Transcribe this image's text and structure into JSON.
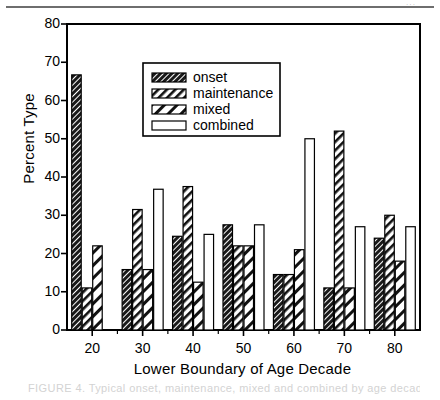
{
  "figure": {
    "top_rule": true,
    "top_corner_mark": "···",
    "caption": "FIGURE 4. Typical onset, maintenance, mixed and combined by age decade"
  },
  "chart_data": {
    "type": "bar",
    "title": "",
    "xlabel": "Lower Boundary of Age Decade",
    "ylabel": "Percent Type",
    "categories": [
      "20",
      "30",
      "40",
      "50",
      "60",
      "70",
      "80"
    ],
    "ylim": [
      0,
      80
    ],
    "yticks": [
      0,
      10,
      20,
      30,
      40,
      50,
      60,
      70,
      80
    ],
    "ytick_labels": [
      "0",
      "10",
      "20",
      "30",
      "40",
      "50",
      "60",
      "70",
      "80"
    ],
    "grid": false,
    "legend_position": "upper center",
    "series": [
      {
        "name": "onset",
        "pattern": "dense-hatch",
        "values": [
          66.7,
          15.8,
          24.5,
          27.5,
          14.5,
          11.0,
          24.0
        ]
      },
      {
        "name": "maintenance",
        "pattern": "medium-hatch",
        "values": [
          11.0,
          31.5,
          37.5,
          22.0,
          14.5,
          52.0,
          30.0
        ]
      },
      {
        "name": "mixed",
        "pattern": "wide-hatch",
        "values": [
          22.0,
          15.8,
          12.5,
          22.0,
          21.0,
          11.0,
          18.0
        ]
      },
      {
        "name": "combined",
        "pattern": "open",
        "values": [
          0,
          36.8,
          25.0,
          27.5,
          50.0,
          27.0,
          27.0
        ]
      }
    ]
  }
}
